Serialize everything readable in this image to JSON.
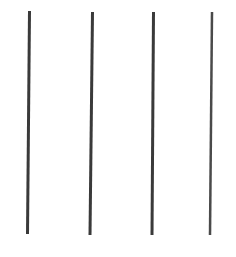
{
  "canvas": {
    "width": 236,
    "height": 257,
    "background": "#ffffff"
  },
  "lines": [
    {
      "id": "line-1",
      "x1": 29.5,
      "y1": 11,
      "x2": 27.5,
      "y2": 234,
      "stroke": "#3a3a3a",
      "width": 3
    },
    {
      "id": "line-2",
      "x1": 92.5,
      "y1": 12,
      "x2": 90.0,
      "y2": 235,
      "stroke": "#3a3a3a",
      "width": 3
    },
    {
      "id": "line-3",
      "x1": 153.5,
      "y1": 12,
      "x2": 152.0,
      "y2": 235,
      "stroke": "#3a3a3a",
      "width": 3
    },
    {
      "id": "line-4",
      "x1": 212.0,
      "y1": 12,
      "x2": 210.0,
      "y2": 235,
      "stroke": "#4a4a4a",
      "width": 2.5
    }
  ]
}
